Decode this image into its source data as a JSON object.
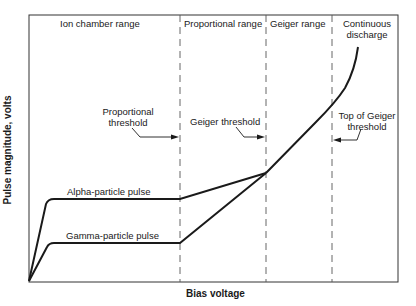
{
  "diagram": {
    "type": "gas-filled detector operating regions",
    "x_axis_label": "Bias voltage",
    "y_axis_label": "Pulse magnitude, volts",
    "regions": [
      {
        "label": "Ion chamber range"
      },
      {
        "label": "Proportional range"
      },
      {
        "label": "Geiger range"
      },
      {
        "label": "Continuous discharge",
        "line1": "Continuous",
        "line2": "discharge"
      }
    ],
    "thresholds": [
      {
        "label": "Proportional threshold",
        "line1": "Proportional",
        "line2": "threshold"
      },
      {
        "label": "Geiger threshold"
      },
      {
        "label": "Top of Geiger threshold",
        "line1": "Top of Geiger",
        "line2": "threshold"
      }
    ],
    "curves": [
      {
        "label": "Alpha-particle pulse"
      },
      {
        "label": "Gamma-particle pulse"
      }
    ],
    "colors": {
      "line": "#1a1a1a",
      "dashed": "#555555",
      "background": "#ffffff"
    }
  }
}
